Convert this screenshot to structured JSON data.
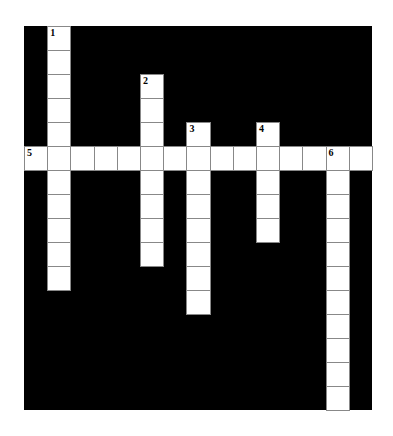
{
  "puzzle": {
    "cols": 15,
    "rows": 16,
    "cell_width": 23.2,
    "cell_height": 24,
    "colors": {
      "block": "#000000",
      "cell": "#ffffff",
      "line": "#888888"
    },
    "entries": [
      {
        "number": "1",
        "direction": "down",
        "row": 0,
        "col": 1,
        "length": 11
      },
      {
        "number": "2",
        "direction": "down",
        "row": 2,
        "col": 5,
        "length": 8
      },
      {
        "number": "3",
        "direction": "down",
        "row": 4,
        "col": 7,
        "length": 8
      },
      {
        "number": "4",
        "direction": "down",
        "row": 4,
        "col": 10,
        "length": 5
      },
      {
        "number": "5",
        "direction": "across",
        "row": 5,
        "col": 0,
        "length": 15
      },
      {
        "number": "6",
        "direction": "down",
        "row": 5,
        "col": 13,
        "length": 11
      }
    ]
  }
}
